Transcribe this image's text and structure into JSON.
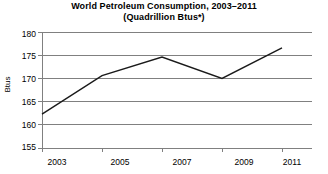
{
  "chart_data": {
    "type": "line",
    "title": "World Petroleum Consumption, 2003–2011",
    "subtitle": "(Quadrillion Btus*)",
    "xlabel": "",
    "ylabel": "Btus",
    "x": [
      2003,
      2005,
      2007,
      2009,
      2011
    ],
    "values": [
      162.3,
      170.6,
      174.6,
      170.0,
      176.6
    ],
    "series": [
      {
        "name": "World Petroleum Consumption",
        "values": [
          162.3,
          170.6,
          174.6,
          170.0,
          176.6
        ]
      }
    ],
    "xlim": [
      2003,
      2012
    ],
    "ylim": [
      155,
      180
    ],
    "ytick_labels": [
      "180",
      "175",
      "170",
      "165",
      "160",
      "155"
    ],
    "ytick_values": [
      180,
      175,
      170,
      165,
      160,
      155
    ],
    "xtick_labels": [
      "2003",
      "2005",
      "2007",
      "2009",
      "2011"
    ],
    "xtick_values": [
      2003,
      2005,
      2007,
      2009,
      2011
    ],
    "grid": "horizontal",
    "legend": "none",
    "line_color": "#1a1a1a",
    "grid_color": "#808080",
    "axis_color": "#808080",
    "background_color": "#ffffff"
  }
}
